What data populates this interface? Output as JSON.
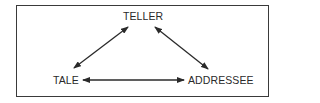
{
  "diagram": {
    "type": "triangle-relationship",
    "nodes": [
      {
        "id": "teller",
        "label": "TELLER"
      },
      {
        "id": "tale",
        "label": "TALE"
      },
      {
        "id": "addressee",
        "label": "ADDRESSEE"
      }
    ],
    "edges": [
      {
        "from": "tale",
        "to": "teller",
        "direction": "bidirectional"
      },
      {
        "from": "teller",
        "to": "addressee",
        "direction": "bidirectional"
      },
      {
        "from": "tale",
        "to": "addressee",
        "direction": "bidirectional"
      }
    ],
    "colors": {
      "stroke": "#2a2a2a",
      "text": "#2a2a2a",
      "border": "#3a3a3a",
      "background": "#ffffff"
    }
  }
}
